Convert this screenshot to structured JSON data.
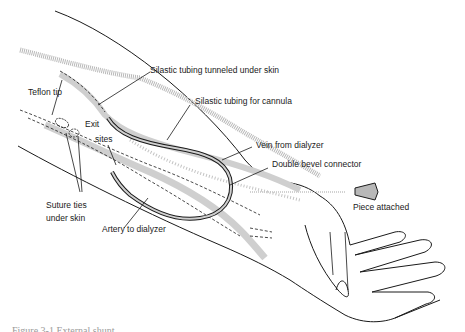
{
  "figure": {
    "labels": {
      "silastic_tunneled": "Silastic tubing tunneled under skin",
      "teflon_tip": "Teflon tip",
      "silastic_cannula": "Silastic tubing for cannula",
      "exit": "Exit",
      "sites": "sites",
      "vein_from_dialyzer": "Vein from dialyzer",
      "double_bevel_connector": "Double bevel connector",
      "piece_attached": "Piece attached",
      "suture_ties": "Suture ties",
      "under_skin": "under skin",
      "artery_to_dialyzer": "Artery to dialyzer"
    },
    "caption_partial": "Figure 3-1  External shunt ..."
  },
  "colors": {
    "line": "#1a1a1a",
    "vessel_fill": "#cfcfcf",
    "stipple": "#b8b8b8",
    "background": "#ffffff"
  }
}
